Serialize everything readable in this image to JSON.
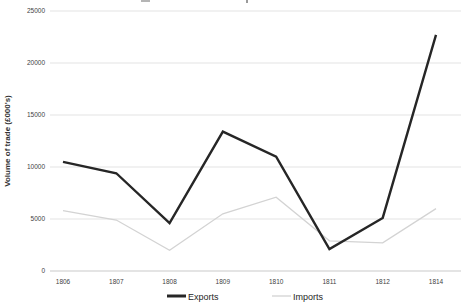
{
  "chart_data": {
    "type": "line",
    "categories": [
      "1806",
      "1807",
      "1808",
      "1809",
      "1810",
      "1811",
      "1812",
      "1814"
    ],
    "series": [
      {
        "name": "Exports",
        "color": "#262626",
        "stroke_width": 2.4,
        "values": [
          10500,
          9400,
          4600,
          13400,
          11000,
          2100,
          5100,
          22700
        ]
      },
      {
        "name": "Imports",
        "color": "#d3d3d3",
        "stroke_width": 1.3,
        "values": [
          5800,
          4900,
          2000,
          5500,
          7100,
          2900,
          2700,
          6000
        ]
      }
    ],
    "ylabel": "Volume of trade (£000's)",
    "xlabel": "",
    "ylim": [
      0,
      25000
    ],
    "yticks": [
      0,
      5000,
      10000,
      15000,
      20000,
      25000
    ],
    "grid": true,
    "legend_position": "bottom",
    "gridline_color": "#e3e3e3",
    "zero_line_color": "#c9c9c9",
    "tick_label_color": "#3f3f3f"
  }
}
